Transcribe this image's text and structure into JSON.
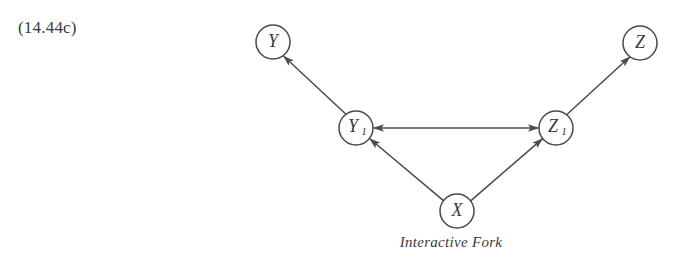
{
  "equation_label": "(14.44c)",
  "caption": "Interactive Fork",
  "colors": {
    "background": "#ffffff",
    "stroke": "#4a4a4c",
    "text": "#3a3a3c"
  },
  "diagram": {
    "type": "causal-graph",
    "nodes": [
      {
        "id": "Y",
        "label": "Y",
        "subscript": "",
        "cx": 273,
        "cy": 42,
        "r": 17
      },
      {
        "id": "Z",
        "label": "Z",
        "subscript": "",
        "cx": 640,
        "cy": 43,
        "r": 17
      },
      {
        "id": "Y1",
        "label": "Y",
        "subscript": "1",
        "cx": 356,
        "cy": 128,
        "r": 17
      },
      {
        "id": "Z1",
        "label": "Z",
        "subscript": "1",
        "cx": 556,
        "cy": 128,
        "r": 17
      },
      {
        "id": "X",
        "label": "X",
        "subscript": "",
        "cx": 457,
        "cy": 211,
        "r": 17
      }
    ],
    "edges": [
      {
        "from": "Y1",
        "to": "Y",
        "arrow": "single"
      },
      {
        "from": "Z1",
        "to": "Z",
        "arrow": "single"
      },
      {
        "from": "X",
        "to": "Y1",
        "arrow": "single"
      },
      {
        "from": "X",
        "to": "Z1",
        "arrow": "single"
      },
      {
        "from": "Y1",
        "to": "Z1",
        "arrow": "double"
      }
    ]
  }
}
